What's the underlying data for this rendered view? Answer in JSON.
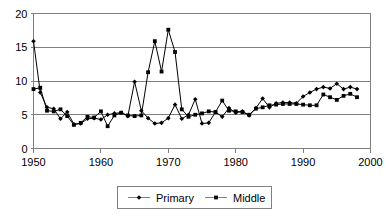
{
  "chart_data": {
    "type": "line",
    "title": "",
    "subtitle": "",
    "xlabel": "",
    "ylabel": "",
    "xlim": [
      1950,
      2000
    ],
    "ylim": [
      0,
      20
    ],
    "xticks": [
      1950,
      1960,
      1970,
      1980,
      1990,
      2000
    ],
    "xticklabels": [
      "1950",
      "1960",
      "1970",
      "1980",
      "1990",
      "2000"
    ],
    "yticks": [
      0,
      5,
      10,
      15,
      20
    ],
    "yticklabels": [
      "0",
      "5",
      "10",
      "15",
      "20"
    ],
    "grid": "horizontal",
    "legend_position": "bottom-center",
    "x": [
      1950,
      1951,
      1952,
      1953,
      1954,
      1955,
      1956,
      1957,
      1958,
      1959,
      1960,
      1961,
      1962,
      1963,
      1964,
      1965,
      1966,
      1967,
      1968,
      1969,
      1970,
      1971,
      1972,
      1973,
      1974,
      1975,
      1976,
      1977,
      1978,
      1979,
      1980,
      1981,
      1982,
      1983,
      1984,
      1985,
      1986,
      1987,
      1988,
      1989,
      1990,
      1991,
      1992,
      1993,
      1994,
      1995,
      1996,
      1997,
      1998
    ],
    "series": [
      {
        "name": "Primary",
        "marker": "diamond",
        "color": "#000000",
        "values": [
          15.9,
          8.3,
          6.1,
          5.9,
          4.4,
          5.4,
          3.6,
          3.7,
          4.4,
          4.5,
          4.3,
          5.0,
          5.2,
          5.3,
          4.8,
          9.9,
          5.6,
          4.5,
          3.7,
          3.8,
          4.5,
          6.5,
          4.4,
          5.0,
          7.3,
          3.7,
          3.8,
          5.4,
          4.7,
          6.0,
          5.3,
          5.5,
          4.9,
          6.0,
          7.4,
          6.1,
          6.7,
          6.8,
          6.8,
          6.7,
          7.7,
          8.3,
          8.8,
          9.1,
          8.9,
          9.6,
          8.8,
          9.1,
          8.8
        ]
      },
      {
        "name": "Middle",
        "marker": "square",
        "color": "#000000",
        "values": [
          8.8,
          9.0,
          5.6,
          5.5,
          5.8,
          4.8,
          3.5,
          3.8,
          4.7,
          4.6,
          5.5,
          3.3,
          4.9,
          5.3,
          4.9,
          4.8,
          4.9,
          11.3,
          15.9,
          11.4,
          17.6,
          14.3,
          5.8,
          4.7,
          5.0,
          5.2,
          5.5,
          5.4,
          7.1,
          5.6,
          5.5,
          5.4,
          5.0,
          5.9,
          6.1,
          6.4,
          6.5,
          6.6,
          6.6,
          6.6,
          6.5,
          6.4,
          6.4,
          8.0,
          7.6,
          7.2,
          7.8,
          8.1,
          7.6
        ]
      }
    ]
  },
  "legend": {
    "entries": [
      {
        "label": "Primary"
      },
      {
        "label": "Middle"
      }
    ]
  }
}
